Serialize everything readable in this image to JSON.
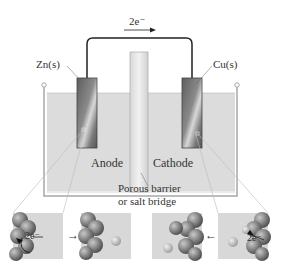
{
  "diagram": {
    "electron_flow_label": "2e⁻",
    "electron_flow_direction": "left-to-right",
    "anode_electrode_label": "Zn(s)",
    "cathode_electrode_label": "Cu(s)",
    "anode_label": "Anode",
    "cathode_label": "Cathode",
    "barrier_label_line1": "Porous barrier",
    "barrier_label_line2": "or salt bridge",
    "insets": [
      {
        "position": "far-left",
        "electron_label": "2e⁻",
        "description": "Zn atom losing 2 electrons at anode surface"
      },
      {
        "position": "left",
        "description": "Zn2+ ion released into solution"
      },
      {
        "position": "right",
        "description": "Cu atom deposited on cathode surface"
      },
      {
        "position": "far-right",
        "electron_label": "2e⁻",
        "description": "Cu2+ ion gaining 2 electrons at cathode surface"
      }
    ],
    "inset_arrow_left": "→",
    "inset_arrow_right": "←",
    "colors": {
      "solution": "#dcdcdc",
      "beaker_outline": "#a8a8a8",
      "electrode_dark": "#6a6a6a",
      "electrode_light": "#cfcfcf",
      "wire": "#222222",
      "barrier": "#e4e4e4"
    }
  }
}
